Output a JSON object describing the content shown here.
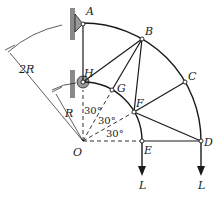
{
  "figure": {
    "points": {
      "A": "A",
      "B": "B",
      "C": "C",
      "D": "D",
      "E": "E",
      "F": "F",
      "G": "G",
      "H": "H",
      "O": "O"
    },
    "dimensions": {
      "outer_radius": "2R",
      "inner_radius": "R"
    },
    "angles": [
      "30°",
      "30°",
      "30°"
    ],
    "loads": [
      "L",
      "L"
    ],
    "colors": {
      "line": "#1a1a1a",
      "support": "#7a7a7a",
      "background": "#ffffff"
    }
  }
}
